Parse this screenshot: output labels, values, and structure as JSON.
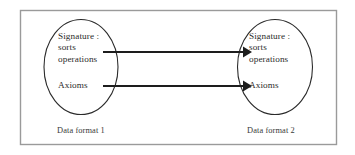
{
  "figure": {
    "border_color": "#9a9a9a",
    "stroke_color": "#2b2b2b",
    "background": "#ffffff",
    "left_group": {
      "signature_label": "Signature :",
      "sorts_label": "sorts",
      "operations_label": "operations",
      "axioms_label": "Axioms",
      "caption": "Data format 1"
    },
    "right_group": {
      "signature_label": "Signature :",
      "sorts_label": "sorts",
      "operations_label": "operations",
      "axioms_label": "Axioms",
      "caption": "Data format 2"
    },
    "arrows": [
      {
        "name": "signature-mapping-arrow",
        "from": "Signature : sorts operations",
        "to": "Signature : sorts operations"
      },
      {
        "name": "axioms-mapping-arrow",
        "from": "Axioms",
        "to": "Axioms"
      }
    ]
  }
}
